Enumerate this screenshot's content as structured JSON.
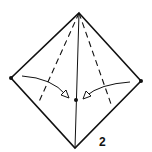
{
  "diagram": {
    "type": "origami-fold-diagram",
    "step_number": "2",
    "colors": {
      "line": "#111111",
      "background": "#ffffff"
    },
    "vertices": {
      "top": [
        79,
        13
      ],
      "left": [
        11,
        78
      ],
      "right": [
        141,
        81
      ],
      "bottom": [
        75,
        148
      ],
      "center": [
        76,
        100
      ]
    },
    "fold_lines": [
      {
        "name": "left-valley-fold",
        "style": "dashed",
        "from": [
          79,
          13
        ],
        "to": [
          38,
          104
        ]
      },
      {
        "name": "right-valley-fold",
        "style": "dashed",
        "from": [
          79,
          13
        ],
        "to": [
          111,
          104
        ]
      },
      {
        "name": "center-crease",
        "style": "solid",
        "from": [
          79,
          13
        ],
        "to": [
          75,
          148
        ]
      }
    ],
    "arrows": [
      {
        "name": "left-fold-arrow",
        "from": [
          22,
          76
        ],
        "to": [
          68,
          97
        ],
        "direction": "fold-in"
      },
      {
        "name": "right-fold-arrow",
        "from": [
          130,
          82
        ],
        "to": [
          84,
          98
        ],
        "direction": "fold-in"
      }
    ],
    "label_position": [
      100,
      136
    ]
  }
}
